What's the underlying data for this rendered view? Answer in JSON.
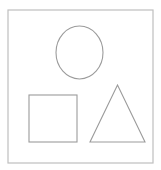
{
  "figure": {
    "title": "Geometric shapes line drawing",
    "background_color": "#ffffff",
    "canvas": {
      "width": 161,
      "height": 170
    }
  },
  "frame": {
    "name": "outer frame rectangle",
    "stroke_color": "#bfbfbf",
    "stroke_width": 1.2,
    "fill": "none",
    "x": 8,
    "y": 10,
    "width": 145,
    "height": 153
  },
  "shapes": [
    {
      "id": "circle",
      "label": "circle",
      "type": "ellipse",
      "stroke_color": "#9b9b9b",
      "stroke_width": 1.1,
      "fill": "none",
      "cx": 79.5,
      "cy": 52.5,
      "rx": 23.5,
      "ry": 26.5
    },
    {
      "id": "square",
      "label": "square",
      "type": "rect",
      "stroke_color": "#9b9b9b",
      "stroke_width": 1.1,
      "fill": "none",
      "x": 29,
      "y": 95,
      "width": 48,
      "height": 47
    },
    {
      "id": "triangle",
      "label": "triangle",
      "type": "polygon",
      "stroke_color": "#9b9b9b",
      "stroke_width": 1.1,
      "fill": "none",
      "points": "117.5,85 145,142 90,142"
    }
  ],
  "counts": {
    "total_shapes": 3
  }
}
